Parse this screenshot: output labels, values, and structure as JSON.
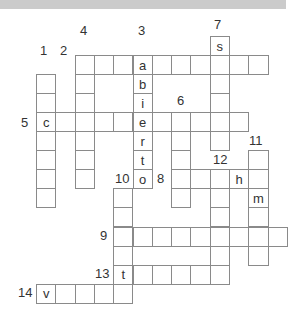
{
  "puzzle": {
    "type": "crossword",
    "grid_origin": {
      "x": 36,
      "y": 36
    },
    "cell_w": 19.3,
    "cell_h": 19.05,
    "colors": {
      "header_bar": "#cbcbcb",
      "cell_border": "#8a8a8a",
      "text": "#333333"
    },
    "entries": [
      {
        "number": "1",
        "direction": "down",
        "row": 2,
        "col": 0,
        "length": 7,
        "letters": ""
      },
      {
        "number": "2",
        "direction": "across",
        "row": 1,
        "col": 2,
        "length": 10,
        "letters": ""
      },
      {
        "number": "3",
        "direction": "down",
        "row": 1,
        "col": 5,
        "length": 7,
        "letters": "abierto"
      },
      {
        "number": "4",
        "direction": "down",
        "row": 1,
        "col": 2,
        "length": 7,
        "letters": ""
      },
      {
        "number": "5",
        "direction": "across",
        "row": 4,
        "col": 0,
        "length": 11,
        "letters": "c"
      },
      {
        "number": "6",
        "direction": "down",
        "row": 4,
        "col": 7,
        "length": 5,
        "letters": ""
      },
      {
        "number": "7",
        "direction": "down",
        "row": 0,
        "col": 9,
        "length": 6,
        "letters": "s"
      },
      {
        "number": "8",
        "direction": "across",
        "row": 7,
        "col": 7,
        "length": 5,
        "letters": "",
        "given": {
          "3": "h"
        }
      },
      {
        "number": "9",
        "direction": "across",
        "row": 10,
        "col": 4,
        "length": 9,
        "letters": ""
      },
      {
        "number": "10",
        "direction": "down",
        "row": 8,
        "col": 4,
        "length": 6,
        "letters": ""
      },
      {
        "number": "11",
        "direction": "down",
        "row": 6,
        "col": 11,
        "length": 6,
        "letters": "",
        "given": {
          "2": "m"
        }
      },
      {
        "number": "12",
        "direction": "down",
        "row": 7,
        "col": 9,
        "length": 6,
        "letters": ""
      },
      {
        "number": "13",
        "direction": "across",
        "row": 12,
        "col": 4,
        "length": 6,
        "letters": "t"
      },
      {
        "number": "14",
        "direction": "across",
        "row": 13,
        "col": 0,
        "length": 5,
        "letters": "v"
      }
    ],
    "labels": [
      {
        "text": "1",
        "x": 40,
        "y": 44
      },
      {
        "text": "2",
        "x": 60,
        "y": 44
      },
      {
        "text": "3",
        "x": 138,
        "y": 24
      },
      {
        "text": "4",
        "x": 80,
        "y": 24
      },
      {
        "text": "5",
        "x": 21,
        "y": 116
      },
      {
        "text": "6",
        "x": 177,
        "y": 94
      },
      {
        "text": "7",
        "x": 214,
        "y": 18
      },
      {
        "text": "8",
        "x": 157,
        "y": 172
      },
      {
        "text": "9",
        "x": 100,
        "y": 229
      },
      {
        "text": "10",
        "x": 115,
        "y": 172
      },
      {
        "text": "11",
        "x": 249,
        "y": 134
      },
      {
        "text": "12",
        "x": 213,
        "y": 153
      },
      {
        "text": "13",
        "x": 95,
        "y": 267
      },
      {
        "text": "14",
        "x": 18,
        "y": 286
      }
    ]
  }
}
